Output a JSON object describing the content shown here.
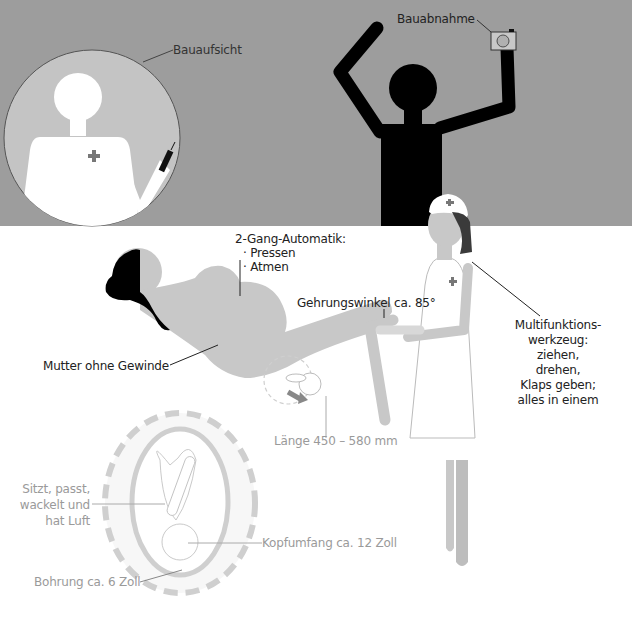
{
  "colors": {
    "top_background": "#9d9d9d",
    "bottom_background": "#ffffff",
    "figure_light": "#c8c8c8",
    "figure_black": "#000000",
    "cross": "#7a7a7a",
    "label_dark": "#222222",
    "label_grey": "#9a9a9a",
    "dashed_ring": "#cfcfcf"
  },
  "labels": {
    "bauaufsicht": "Bauaufsicht",
    "bauabnahme": "Bauabnahme",
    "automatik": {
      "title": "2-Gang-Automatik:",
      "items": [
        "· Pressen",
        "· Atmen"
      ]
    },
    "gehrungswinkel": "Gehrungswinkel ca. 85°",
    "mutter": "Mutter ohne Gewinde",
    "multifunktion": [
      "Multifunktions-",
      "werkzeug:",
      "ziehen,",
      "drehen,",
      "Klaps geben;",
      "alles in einem"
    ],
    "laenge": "Länge 450 – 580 mm",
    "sitzt": [
      "Sitzt, passt,",
      "wackelt und",
      "hat Luft"
    ],
    "kopfumfang": "Kopfumfang ca. 12 Zoll",
    "bohrung": "Bohrung ca. 6 Zoll"
  }
}
